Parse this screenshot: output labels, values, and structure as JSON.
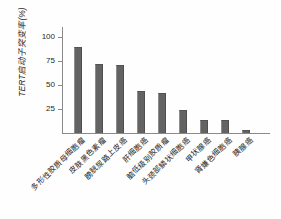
{
  "chart_data": {
    "type": "bar",
    "title": "",
    "xlabel": "",
    "ylabel": "TERT启动子突变率(%)",
    "ylim": [
      0,
      110
    ],
    "yticks": [
      25,
      50,
      75,
      100
    ],
    "grid": false,
    "legend": null,
    "bar_color": "#636363",
    "axis_color": "#8a8a8a",
    "categories": [
      "多形性胶质母细胞瘤",
      "皮肤黑色素瘤",
      "膀胱尿路上皮癌",
      "肝细胞癌",
      "脑低级别胶质瘤",
      "头颈部鳞状细胞癌",
      "甲状腺癌",
      "肾嫌色细胞癌",
      "胰腺癌"
    ],
    "values": [
      89,
      72,
      71,
      44,
      42,
      24,
      14,
      14,
      3
    ]
  }
}
